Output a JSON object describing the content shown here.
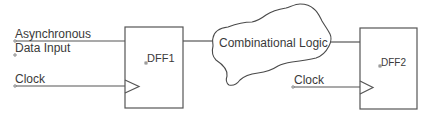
{
  "diagram": {
    "type": "circuit-schematic",
    "inputs": {
      "async_label_line1": "Asynchronous",
      "async_label_line2": "Data Input",
      "clock1_label": "Clock",
      "clock2_label": "Clock"
    },
    "blocks": {
      "dff1": {
        "label": "DFF1"
      },
      "logic": {
        "label": "Combinational Logic"
      },
      "dff2": {
        "label": "DFF2"
      }
    },
    "connections": [
      {
        "from": "Asynchronous Data Input",
        "to": "DFF1.D"
      },
      {
        "from": "Clock",
        "to": "DFF1.CLK"
      },
      {
        "from": "DFF1.Q",
        "to": "Combinational Logic"
      },
      {
        "from": "Combinational Logic",
        "to": "DFF2.D"
      },
      {
        "from": "Clock",
        "to": "DFF2.CLK"
      }
    ],
    "colors": {
      "line": "#555555",
      "text": "#3a3a3a",
      "background": "#ffffff"
    }
  }
}
